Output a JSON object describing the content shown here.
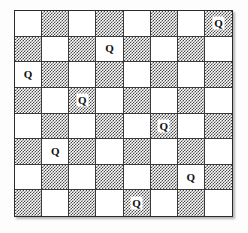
{
  "figure": {
    "title": "Eight queens puzzle solution board",
    "board_size": 8,
    "square_label_light": "light square",
    "square_label_dark": "dark square",
    "queen_glyph": "Q",
    "queen_icon_name": "queen-icon"
  },
  "colors": {
    "background": "#fdfdfd",
    "board_border": "#2b2b2b",
    "grid_line": "#3a3a3a",
    "light_square": "#ffffff",
    "dark_square_ink": "#4a4a4a",
    "queen_text": "#111111"
  },
  "chart_data": {
    "type": "heatmap",
    "title": "Eight queens puzzle solution board",
    "xlabel": "",
    "ylabel": "",
    "rows": 8,
    "columns": 8,
    "grid": true,
    "legend": "",
    "categories_x": [
      "1",
      "2",
      "3",
      "4",
      "5",
      "6",
      "7",
      "8"
    ],
    "categories_y": [
      "1",
      "2",
      "3",
      "4",
      "5",
      "6",
      "7",
      "8"
    ],
    "queens": [
      {
        "row": 1,
        "col": 8,
        "square": "dark",
        "label": "Q"
      },
      {
        "row": 2,
        "col": 4,
        "square": "light",
        "label": "Q"
      },
      {
        "row": 3,
        "col": 1,
        "square": "light",
        "label": "Q"
      },
      {
        "row": 4,
        "col": 3,
        "square": "dark",
        "label": "Q"
      },
      {
        "row": 5,
        "col": 6,
        "square": "dark",
        "label": "Q"
      },
      {
        "row": 6,
        "col": 2,
        "square": "light",
        "label": "Q"
      },
      {
        "row": 7,
        "col": 7,
        "square": "light",
        "label": "Q"
      },
      {
        "row": 8,
        "col": 5,
        "square": "dark",
        "label": "Q"
      }
    ],
    "queen_columns_by_row": [
      8,
      4,
      1,
      3,
      6,
      2,
      7,
      5
    ],
    "values": [
      [
        0,
        0,
        0,
        0,
        0,
        0,
        0,
        1
      ],
      [
        0,
        0,
        0,
        1,
        0,
        0,
        0,
        0
      ],
      [
        1,
        0,
        0,
        0,
        0,
        0,
        0,
        0
      ],
      [
        0,
        0,
        1,
        0,
        0,
        0,
        0,
        0
      ],
      [
        0,
        0,
        0,
        0,
        0,
        1,
        0,
        0
      ],
      [
        0,
        1,
        0,
        0,
        0,
        0,
        0,
        0
      ],
      [
        0,
        0,
        0,
        0,
        0,
        0,
        1,
        0
      ],
      [
        0,
        0,
        0,
        0,
        1,
        0,
        0,
        0
      ]
    ],
    "shading": [
      [
        "light",
        "dark",
        "light",
        "dark",
        "light",
        "dark",
        "light",
        "dark"
      ],
      [
        "dark",
        "light",
        "dark",
        "light",
        "dark",
        "light",
        "dark",
        "light"
      ],
      [
        "light",
        "dark",
        "light",
        "dark",
        "light",
        "dark",
        "light",
        "dark"
      ],
      [
        "dark",
        "light",
        "dark",
        "light",
        "dark",
        "light",
        "dark",
        "light"
      ],
      [
        "light",
        "dark",
        "light",
        "dark",
        "light",
        "dark",
        "light",
        "dark"
      ],
      [
        "dark",
        "light",
        "dark",
        "light",
        "dark",
        "light",
        "dark",
        "light"
      ],
      [
        "light",
        "dark",
        "light",
        "dark",
        "light",
        "dark",
        "light",
        "dark"
      ],
      [
        "dark",
        "light",
        "dark",
        "light",
        "dark",
        "light",
        "dark",
        "light"
      ]
    ]
  }
}
